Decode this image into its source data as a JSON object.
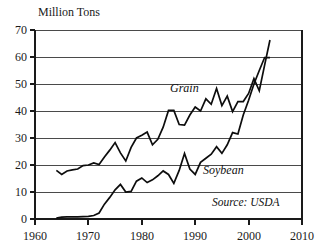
{
  "chart_data": {
    "type": "line",
    "title": "Million Tons",
    "xlabel": "",
    "ylabel": "Million Tons",
    "xlim": [
      1960,
      2010
    ],
    "ylim": [
      0,
      70
    ],
    "xticks": [
      1960,
      1970,
      1980,
      1990,
      2000,
      2010
    ],
    "yticks": [
      0,
      10,
      20,
      30,
      40,
      50,
      60,
      70
    ],
    "grid": true,
    "legend_position": "inline-annotations",
    "annotations": [
      {
        "text": "Grain",
        "x": 1988,
        "y": 47
      },
      {
        "text": "Soybean",
        "x": 1993,
        "y": 17
      },
      {
        "text": "Source: USDA",
        "x": 2000,
        "y": 6
      }
    ],
    "series": [
      {
        "name": "Grain",
        "x": [
          1964,
          1965,
          1966,
          1967,
          1968,
          1969,
          1970,
          1971,
          1972,
          1973,
          1974,
          1975,
          1976,
          1977,
          1978,
          1979,
          1980,
          1981,
          1982,
          1983,
          1984,
          1985,
          1986,
          1987,
          1988,
          1989,
          1990,
          1991,
          1992,
          1993,
          1994,
          1995,
          1996,
          1997,
          1998,
          1999,
          2000,
          2001,
          2002,
          2003,
          2004
        ],
        "values": [
          18.0,
          16.5,
          17.8,
          18.2,
          18.5,
          19.8,
          20.0,
          20.8,
          20.2,
          23.0,
          25.5,
          28.3,
          24.5,
          21.5,
          26.5,
          30.0,
          31.0,
          32.2,
          27.5,
          29.5,
          34.0,
          40.2,
          40.2,
          35.0,
          34.8,
          38.5,
          41.5,
          40.0,
          44.5,
          42.5,
          48.3,
          42.0,
          45.5,
          39.8,
          43.5,
          43.5,
          46.5,
          52.0,
          47.5,
          57.0,
          66.3
        ]
      },
      {
        "name": "Soybean",
        "x": [
          1964,
          1965,
          1966,
          1967,
          1968,
          1969,
          1970,
          1971,
          1972,
          1973,
          1974,
          1975,
          1976,
          1977,
          1978,
          1979,
          1980,
          1981,
          1982,
          1983,
          1984,
          1985,
          1986,
          1987,
          1988,
          1989,
          1990,
          1991,
          1992,
          1993,
          1994,
          1995,
          1996,
          1997,
          1998,
          1999,
          2000,
          2001,
          2002,
          2003,
          2004
        ],
        "values": [
          0.3,
          0.7,
          0.8,
          0.8,
          0.8,
          0.9,
          1.0,
          1.3,
          2.2,
          5.5,
          8.0,
          10.8,
          12.8,
          10.0,
          10.2,
          14.0,
          15.2,
          13.5,
          14.5,
          16.0,
          17.8,
          16.5,
          13.2,
          18.0,
          24.3,
          18.5,
          16.5,
          21.0,
          22.5,
          24.0,
          26.8,
          24.3,
          27.5,
          32.0,
          31.5,
          38.5,
          44.0,
          50.0,
          55.0,
          59.8,
          59.8
        ]
      }
    ]
  },
  "axis": {
    "y_title": "Million Tons",
    "y_labels": [
      "70",
      "60",
      "50",
      "40",
      "30",
      "20",
      "10",
      "0"
    ],
    "x_labels": [
      "1960",
      "1970",
      "1980",
      "1990",
      "2000",
      "2010"
    ]
  },
  "labels": {
    "grain": "Grain",
    "soybean": "Soybean",
    "source": "Source: USDA"
  },
  "colors": {
    "background": "#ffffff",
    "line": "#0d0d0d",
    "grid": "#4a4a4a",
    "axis": "#1a1a1a",
    "text": "#1a1a1a"
  }
}
